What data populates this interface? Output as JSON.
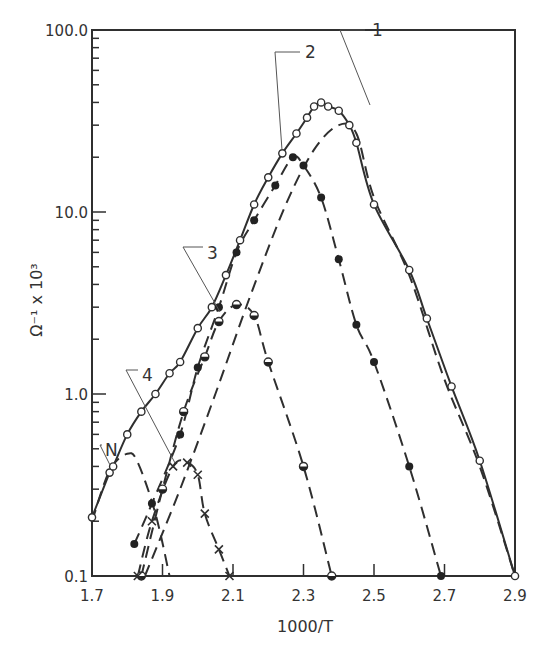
{
  "chart_data": {
    "type": "line",
    "title": "",
    "xlabel": "1000/T",
    "ylabel": "Ω⁻¹ x 10³",
    "yscale": "log",
    "xlim": [
      1.7,
      2.9
    ],
    "ylim": [
      0.1,
      100.0
    ],
    "x_ticks": [
      "1.7",
      "1.9",
      "2.1",
      "2.3",
      "2.5",
      "2.7",
      "2.9"
    ],
    "y_ticks": [
      "0.1",
      "1.0",
      "10.0",
      "100.0"
    ],
    "grid": false,
    "legend": "none (curves labelled by callouts)",
    "callouts": [
      "1",
      "2",
      "3",
      "4",
      "N"
    ],
    "series": [
      {
        "name": "Total (solid curve, open circles)",
        "style": "solid",
        "marker": "open-circle",
        "points": [
          [
            1.7,
            0.21
          ],
          [
            1.75,
            0.37
          ],
          [
            1.76,
            0.4
          ],
          [
            1.8,
            0.6
          ],
          [
            1.84,
            0.8
          ],
          [
            1.88,
            1.0
          ],
          [
            1.92,
            1.3
          ],
          [
            1.95,
            1.5
          ],
          [
            2.0,
            2.3
          ],
          [
            2.04,
            3.0
          ],
          [
            2.08,
            4.5
          ],
          [
            2.12,
            7.0
          ],
          [
            2.16,
            11.0
          ],
          [
            2.2,
            15.5
          ],
          [
            2.24,
            21.0
          ],
          [
            2.28,
            27.0
          ],
          [
            2.31,
            33.0
          ],
          [
            2.33,
            38.0
          ],
          [
            2.35,
            40.0
          ],
          [
            2.37,
            38.0
          ],
          [
            2.4,
            36.0
          ],
          [
            2.43,
            30.0
          ],
          [
            2.45,
            24.0
          ],
          [
            2.5,
            11.0
          ],
          [
            2.6,
            4.8
          ],
          [
            2.65,
            2.6
          ],
          [
            2.72,
            1.1
          ],
          [
            2.8,
            0.43
          ],
          [
            2.9,
            0.1
          ]
        ]
      },
      {
        "name": "Component 1 (dashed)",
        "style": "dashed",
        "points": [
          [
            1.85,
            0.1
          ],
          [
            1.95,
            0.3
          ],
          [
            2.05,
            1.0
          ],
          [
            2.15,
            3.5
          ],
          [
            2.25,
            11.0
          ],
          [
            2.33,
            22.0
          ],
          [
            2.4,
            30.0
          ],
          [
            2.45,
            27.0
          ],
          [
            2.5,
            12.0
          ],
          [
            2.6,
            4.5
          ],
          [
            2.7,
            1.2
          ],
          [
            2.8,
            0.4
          ],
          [
            2.9,
            0.1
          ]
        ]
      },
      {
        "name": "Component 2 (dashed, filled circles)",
        "style": "dashed",
        "marker": "filled-circle",
        "points": [
          [
            1.82,
            0.15
          ],
          [
            1.87,
            0.25
          ],
          [
            1.95,
            0.6
          ],
          [
            2.0,
            1.4
          ],
          [
            2.06,
            3.0
          ],
          [
            2.11,
            6.0
          ],
          [
            2.16,
            9.0
          ],
          [
            2.22,
            14.0
          ],
          [
            2.27,
            20.0
          ],
          [
            2.3,
            18.0
          ],
          [
            2.35,
            12.0
          ],
          [
            2.4,
            5.5
          ],
          [
            2.45,
            2.4
          ],
          [
            2.5,
            1.5
          ],
          [
            2.6,
            0.4
          ],
          [
            2.69,
            0.1
          ]
        ]
      },
      {
        "name": "Component 3 (dashed, half-filled circles)",
        "style": "dashed",
        "marker": "half-circle",
        "points": [
          [
            1.84,
            0.1
          ],
          [
            1.9,
            0.3
          ],
          [
            1.96,
            0.8
          ],
          [
            2.02,
            1.6
          ],
          [
            2.06,
            2.5
          ],
          [
            2.11,
            3.1
          ],
          [
            2.16,
            2.7
          ],
          [
            2.2,
            1.5
          ],
          [
            2.3,
            0.4
          ],
          [
            2.38,
            0.1
          ]
        ]
      },
      {
        "name": "Component 4 (dashed, crosses)",
        "style": "dashed",
        "marker": "cross",
        "points": [
          [
            1.83,
            0.1
          ],
          [
            1.87,
            0.2
          ],
          [
            1.93,
            0.4
          ],
          [
            1.97,
            0.42
          ],
          [
            2.0,
            0.36
          ],
          [
            2.02,
            0.22
          ],
          [
            2.06,
            0.14
          ],
          [
            2.09,
            0.1
          ]
        ]
      },
      {
        "name": "Component N (dashed)",
        "style": "dashed",
        "points": [
          [
            1.7,
            0.2
          ],
          [
            1.75,
            0.38
          ],
          [
            1.8,
            0.47
          ],
          [
            1.83,
            0.42
          ],
          [
            1.88,
            0.22
          ],
          [
            1.92,
            0.1
          ]
        ]
      }
    ]
  }
}
